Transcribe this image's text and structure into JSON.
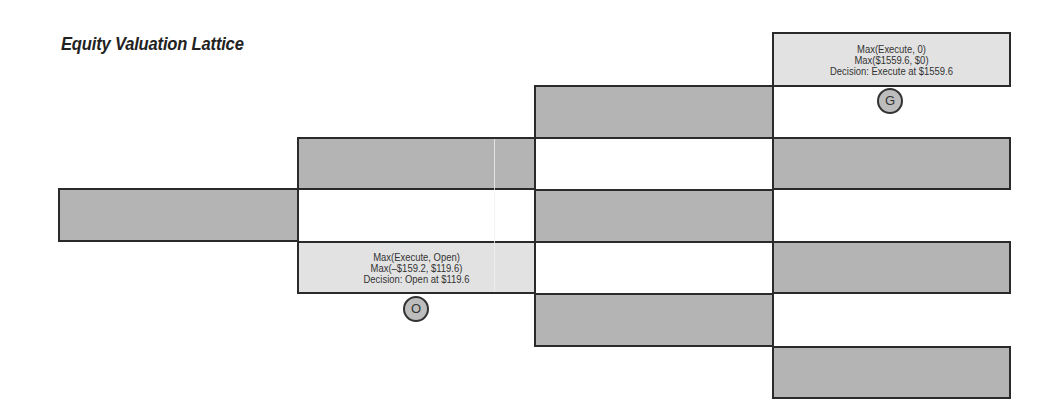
{
  "diagram": {
    "title": "Equity Valuation Lattice",
    "columns": 4,
    "colors": {
      "dark_node_fill": "#b4b4b4",
      "light_node_fill": "#e2e2e2",
      "border": "#2a2a2a",
      "badge_fill": "#bdbdbd",
      "text": "#333333"
    },
    "nodes": [
      {
        "id": "c1r1",
        "column": 1,
        "style": "dark"
      },
      {
        "id": "c2r1",
        "column": 2,
        "style": "dark"
      },
      {
        "id": "c2r2",
        "column": 2,
        "style": "light",
        "lines": [
          "Max(Execute, Open)",
          "Max(–$159.2, $119.6)",
          "Decision: Open at $119.6"
        ],
        "badge": "O"
      },
      {
        "id": "c3r1",
        "column": 3,
        "style": "dark"
      },
      {
        "id": "c3r2",
        "column": 3,
        "style": "dark"
      },
      {
        "id": "c3r3",
        "column": 3,
        "style": "dark"
      },
      {
        "id": "c4r1",
        "column": 4,
        "style": "light",
        "lines": [
          "Max(Execute, 0)",
          "Max($1559.6, $0)",
          "Decision: Execute at $1559.6"
        ],
        "badge": "G"
      },
      {
        "id": "c4r2",
        "column": 4,
        "style": "dark"
      },
      {
        "id": "c4r3",
        "column": 4,
        "style": "dark"
      },
      {
        "id": "c4r4",
        "column": 4,
        "style": "dark"
      }
    ]
  }
}
